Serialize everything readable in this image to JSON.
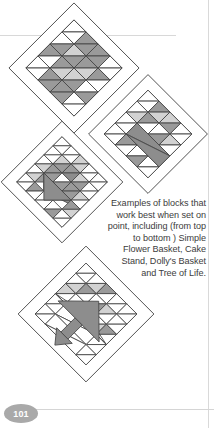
{
  "page": {
    "folio": "101",
    "background_color": "#ffffff",
    "rule_color": "#d8d8d8"
  },
  "caption": {
    "text": "Examples of blocks that work best when set on point, including (from top to bottom ) Simple Flower Basket, Cake Stand, Dolly's Basket and Tree of Life.",
    "lines": [
      "Examples of blocks",
      "that work best",
      "when set on point,",
      "including (from top",
      "to bottom ) Simple",
      "Flower Basket,",
      "Cake Stand, Dolly's",
      "Basket and Tree",
      "of Life."
    ],
    "align": "right",
    "color": "#3c3c3c"
  },
  "palette": {
    "white": "#ffffff",
    "light_gray": "#d0d0d0",
    "mid_gray": "#9a9a9a",
    "dark_gray": "#878787",
    "outline": "#3a3a3a",
    "block_outline": "#555555"
  },
  "blocks": [
    {
      "name": "simple-flower-basket",
      "label": "Simple Flower Basket",
      "order": 1,
      "set_on_point": true,
      "grid": 4,
      "position": {
        "x": 8,
        "y": 2
      },
      "size": 124
    },
    {
      "name": "cake-stand",
      "label": "Cake Stand",
      "order": 2,
      "set_on_point": true,
      "grid": 4,
      "position": {
        "x": 92,
        "y": 80
      },
      "size": 116
    },
    {
      "name": "dollys-basket",
      "label": "Dolly's Basket",
      "order": 3,
      "set_on_point": true,
      "grid": 5,
      "position": {
        "x": 6,
        "y": 128
      },
      "size": 118
    },
    {
      "name": "tree-of-life",
      "label": "Tree of Life",
      "order": 4,
      "set_on_point": true,
      "grid": 5,
      "position": {
        "x": 22,
        "y": 252
      },
      "size": 134
    }
  ]
}
